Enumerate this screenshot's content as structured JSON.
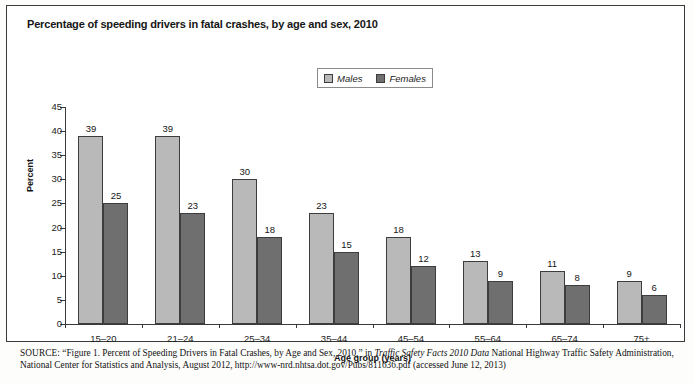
{
  "figure": {
    "title": "Percentage of speeding drivers in fatal crashes, by age and sex, 2010",
    "source_prefix": "SOURCE:",
    "source_part1": " “Figure 1. Percent of Speeding Drivers in Fatal Crashes, by Age and Sex, 2010,” in ",
    "source_italic": "Traffic Safety Facts 2010 Data",
    "source_part2": " National Highway Traffic Safety Administration, National Center for Statistics and Analysis, August 2012, http://www-nrd.nhtsa.dot.gov/Pubs/811636.pdf (accessed June 12, 2013)"
  },
  "legend": {
    "position": "top-center",
    "items": [
      {
        "label": "Males",
        "color": "#b9b9b9",
        "swatch": "males-swatch"
      },
      {
        "label": "Females",
        "color": "#6f6f6f",
        "swatch": "females-swatch"
      }
    ]
  },
  "chart_data": {
    "type": "bar",
    "title": "Percentage of speeding drivers in fatal crashes, by age and sex, 2010",
    "xlabel": "Age group (years)",
    "ylabel": "Percent",
    "categories": [
      "15–20",
      "21–24",
      "25–34",
      "35–44",
      "45–54",
      "55–64",
      "65–74",
      "75+"
    ],
    "series": [
      {
        "name": "Males",
        "color": "#b9b9b9",
        "values": [
          39,
          39,
          30,
          23,
          18,
          13,
          11,
          9
        ]
      },
      {
        "name": "Females",
        "color": "#6f6f6f",
        "values": [
          25,
          23,
          18,
          15,
          12,
          9,
          8,
          6
        ]
      }
    ],
    "ylim": [
      0,
      45
    ],
    "yticks": [
      0,
      5,
      10,
      15,
      20,
      25,
      30,
      35,
      40,
      45
    ],
    "ytick_labels": [
      "0",
      "5",
      "10",
      "15",
      "20",
      "25",
      "30",
      "35",
      "40",
      "45"
    ],
    "grid": false,
    "data_labels": true,
    "legend_position": "top-center"
  }
}
